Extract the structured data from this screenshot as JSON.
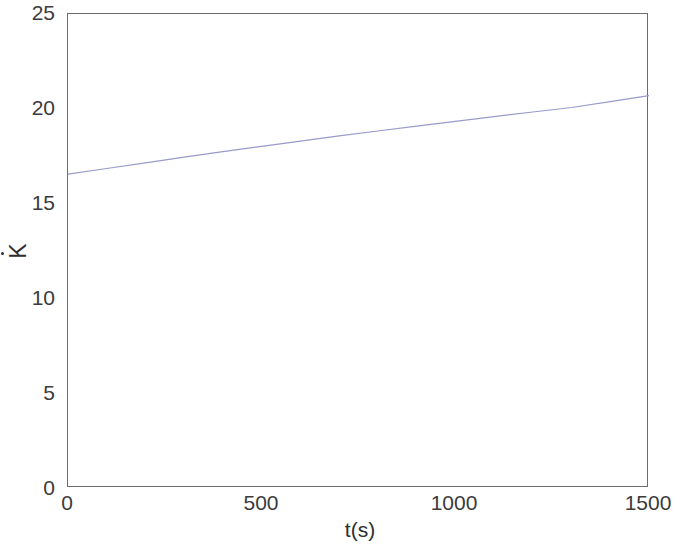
{
  "figure": {
    "background_color": "#ffffff",
    "axis_color": "#6b6b70",
    "text_color": "#3b3b3b"
  },
  "chart_data": {
    "type": "line",
    "title": "",
    "subtitle": "",
    "xlabel": "t(s)",
    "ylabel": "K̇",
    "xlim": [
      0,
      1500
    ],
    "ylim": [
      0,
      25
    ],
    "xticks": [
      0,
      500,
      1000,
      1500
    ],
    "yticks": [
      0,
      5,
      10,
      15,
      20,
      25
    ],
    "xticklabels": [
      "0",
      "500",
      "1000",
      "1500"
    ],
    "yticklabels": [
      "0",
      "5",
      "10",
      "15",
      "20",
      "25"
    ],
    "grid": false,
    "legend": null,
    "legend_position": "none",
    "box": true,
    "annotations": [],
    "series": [
      {
        "name": "K-dot",
        "color": "#9a9acb",
        "line_width": 1.2,
        "style": "solid",
        "x": [
          0,
          100,
          200,
          300,
          400,
          500,
          600,
          700,
          800,
          900,
          1000,
          1100,
          1200,
          1300,
          1400,
          1500
        ],
        "values": [
          16.55,
          16.85,
          17.15,
          17.45,
          17.74,
          18.02,
          18.3,
          18.57,
          18.83,
          19.09,
          19.34,
          19.59,
          19.83,
          20.07,
          20.38,
          20.7
        ]
      }
    ]
  }
}
